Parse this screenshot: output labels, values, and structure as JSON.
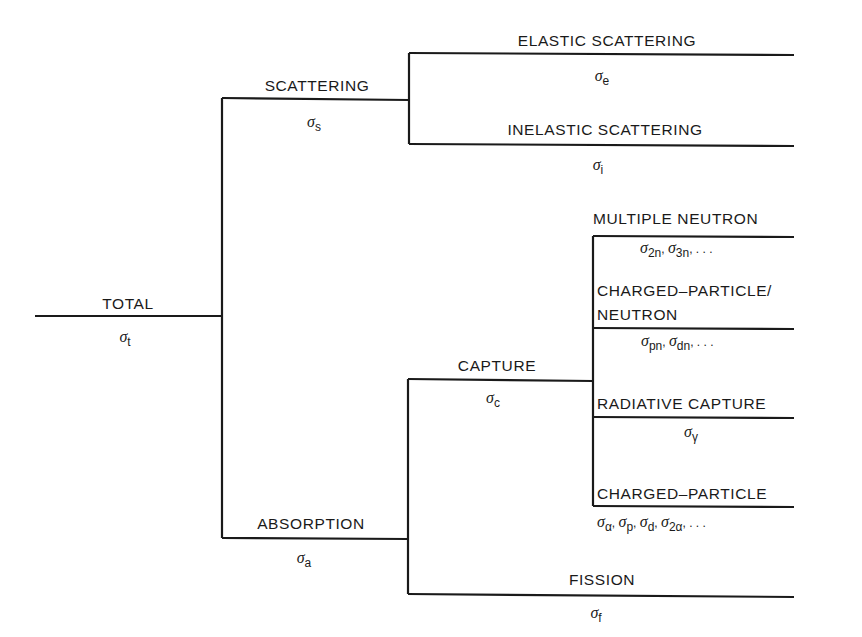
{
  "diagram": {
    "nodes": [
      {
        "id": "total",
        "label": "TOTAL",
        "symbol": "σ",
        "subscript": "t"
      },
      {
        "id": "scattering",
        "label": "SCATTERING",
        "symbol": "σ",
        "subscript": "s",
        "parent": "total"
      },
      {
        "id": "absorption",
        "label": "ABSORPTION",
        "symbol": "σ",
        "subscript": "a",
        "parent": "total"
      },
      {
        "id": "elastic",
        "label": "ELASTIC SCATTERING",
        "symbol": "σ",
        "subscript": "e",
        "parent": "scattering"
      },
      {
        "id": "inelastic",
        "label": "INELASTIC SCATTERING",
        "symbol": "σ",
        "subscript": "i",
        "parent": "scattering"
      },
      {
        "id": "capture",
        "label": "CAPTURE",
        "symbol": "σ",
        "subscript": "c",
        "parent": "absorption"
      },
      {
        "id": "fission",
        "label": "FISSION",
        "symbol": "σ",
        "subscript": "f",
        "parent": "absorption"
      },
      {
        "id": "multiple-neutron",
        "label": "MULTIPLE NEUTRON",
        "symbol_text": "σ2n, σ3n, . . .",
        "parent": "capture"
      },
      {
        "id": "charged-particle-neutron",
        "label_line1": "CHARGED–PARTICLE/",
        "label_line2": "NEUTRON",
        "symbol_text": "σpn, σdn, . . .",
        "parent": "capture"
      },
      {
        "id": "radiative-capture",
        "label": "RADIATIVE CAPTURE",
        "symbol": "σ",
        "subscript": "γ",
        "parent": "capture"
      },
      {
        "id": "charged-particle",
        "label": "CHARGED–PARTICLE",
        "symbol_text": "σα, σp, σd, σ2α, . . .",
        "parent": "capture"
      }
    ],
    "symbols": {
      "total": {
        "s": "σ",
        "sub": "t"
      },
      "scattering": {
        "s": "σ",
        "sub": "s"
      },
      "absorption": {
        "s": "σ",
        "sub": "a"
      },
      "elastic": {
        "s": "σ",
        "sub": "e"
      },
      "inelastic": {
        "s": "σ",
        "sub": "i"
      },
      "capture": {
        "s": "σ",
        "sub": "c"
      },
      "fission": {
        "s": "σ",
        "sub": "f"
      },
      "radiative": {
        "s": "σ",
        "sub": "γ"
      },
      "multiple": [
        {
          "s": "σ",
          "sub": "2n"
        },
        {
          "s": "σ",
          "sub": "3n"
        },
        {
          "ellipsis": ", . . ."
        }
      ],
      "cpn": [
        {
          "s": "σ",
          "sub": "pn"
        },
        {
          "s": "σ",
          "sub": "dn"
        },
        {
          "ellipsis": ", . . ."
        }
      ],
      "cp": [
        {
          "s": "σ",
          "sub": "α"
        },
        {
          "s": "σ",
          "sub": "p"
        },
        {
          "s": "σ",
          "sub": "d"
        },
        {
          "s": "σ",
          "sub": "2α"
        },
        {
          "ellipsis": ", . . ."
        }
      ]
    },
    "labels": {
      "total": "TOTAL",
      "scattering": "SCATTERING",
      "absorption": "ABSORPTION",
      "elastic": "ELASTIC SCATTERING",
      "inelastic": "INELASTIC SCATTERING",
      "capture": "CAPTURE",
      "fission": "FISSION",
      "multiple": "MULTIPLE NEUTRON",
      "cpn_line1": "CHARGED–PARTICLE/",
      "cpn_line2": "NEUTRON",
      "radiative": "RADIATIVE CAPTURE",
      "cp": "CHARGED–PARTICLE"
    }
  }
}
